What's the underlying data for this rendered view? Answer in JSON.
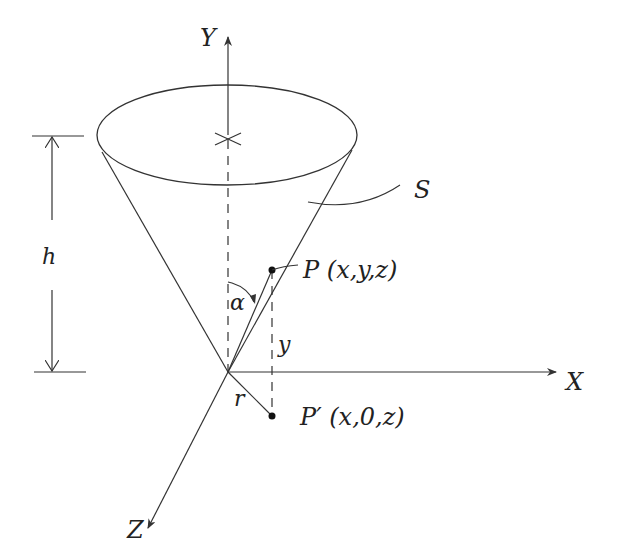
{
  "diagram": {
    "axes": {
      "x_label": "X",
      "y_label": "Y",
      "z_label": "Z"
    },
    "surface_label": "S",
    "height_label": "h",
    "angle_label": "α",
    "radius_label": "r",
    "y_distance_label": "y",
    "point_p": {
      "name": "P",
      "coords": "(x,y,z)"
    },
    "point_p_prime": {
      "name": "P′",
      "coords": "(x,0,z)"
    },
    "colors": {
      "stroke": "#333333",
      "background": "#ffffff"
    }
  }
}
